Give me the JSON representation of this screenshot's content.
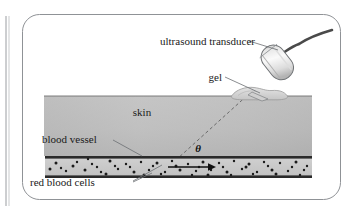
{
  "figure": {
    "type": "medical-illustration",
    "background_color": "#ffffff",
    "frame": {
      "name": "rounded-panel-border",
      "color": "#8f9296",
      "x": 22,
      "y": 14,
      "width": 319,
      "height": 186,
      "radius": 17
    },
    "left_rule": {
      "name": "page-margin-rule",
      "color": "#9a9da1",
      "x": 6,
      "y_top": 16,
      "y_bottom": 206
    },
    "labels": {
      "transducer": "ultrasound transducer",
      "gel": "gel",
      "skin": "skin",
      "blood_vessel": "blood vessel",
      "red_blood_cells": "red blood cells",
      "angle": "θ"
    },
    "colors": {
      "skin_fill_top": "#c3c3c3",
      "skin_fill_bottom": "#b0b0b0",
      "vessel_wall": "#2a2a2a",
      "vessel_lumen": "#c9c9c9",
      "red_blood_cell": "#1b1b1b",
      "transducer_body_light": "#f4f4f4",
      "transducer_body_shade": "#c4c4c4",
      "transducer_outline": "#6e7174",
      "cable": "#4a4a4a",
      "gel_fill": "#d8d8d8",
      "gel_outline": "#9b9b9b",
      "beam_dashed": "#6d6d6d",
      "leader_line": "#6b6e72",
      "text": "#1a1a1a"
    },
    "geometry": {
      "skin_surface_y": 96,
      "skin_left_x": 44,
      "skin_right_x": 312,
      "vessel_top_y": 156,
      "vessel_bottom_y": 178,
      "vessel_left_x": 45,
      "vessel_right_x": 312,
      "beam_start": {
        "x": 251,
        "y": 92
      },
      "beam_end": {
        "x": 176,
        "y": 160
      },
      "flow_arrow": {
        "x1": 168,
        "y1": 167,
        "x2": 214,
        "y2": 167
      }
    },
    "red_blood_cells_points": [
      [
        56,
        163
      ],
      [
        66,
        171
      ],
      [
        77,
        162
      ],
      [
        85,
        170
      ],
      [
        92,
        164
      ],
      [
        101,
        172
      ],
      [
        110,
        161
      ],
      [
        118,
        169
      ],
      [
        126,
        164
      ],
      [
        134,
        172
      ],
      [
        141,
        162
      ],
      [
        149,
        170
      ],
      [
        157,
        163
      ],
      [
        165,
        172
      ],
      [
        172,
        161
      ],
      [
        180,
        170
      ],
      [
        188,
        164
      ],
      [
        196,
        171
      ],
      [
        203,
        162
      ],
      [
        211,
        170
      ],
      [
        219,
        163
      ],
      [
        227,
        172
      ],
      [
        234,
        161
      ],
      [
        242,
        169
      ],
      [
        249,
        164
      ],
      [
        257,
        172
      ],
      [
        264,
        162
      ],
      [
        272,
        170
      ],
      [
        280,
        163
      ],
      [
        288,
        171
      ],
      [
        296,
        162
      ],
      [
        304,
        170
      ],
      [
        61,
        168
      ],
      [
        73,
        166
      ],
      [
        88,
        159
      ],
      [
        97,
        167
      ],
      [
        106,
        174
      ],
      [
        115,
        166
      ],
      [
        130,
        167
      ],
      [
        144,
        175
      ],
      [
        153,
        166
      ],
      [
        161,
        174
      ],
      [
        176,
        166
      ],
      [
        192,
        175
      ],
      [
        199,
        167
      ],
      [
        208,
        175
      ],
      [
        223,
        167
      ],
      [
        231,
        175
      ],
      [
        246,
        167
      ],
      [
        253,
        174
      ],
      [
        268,
        166
      ],
      [
        276,
        174
      ],
      [
        292,
        167
      ],
      [
        300,
        175
      ],
      [
        50,
        169
      ],
      [
        307,
        166
      ]
    ],
    "leaders": {
      "transducer": {
        "x1": 249,
        "y1": 41,
        "x2": 276,
        "y2": 51
      },
      "gel": {
        "x1": 225,
        "y1": 77,
        "x2": 259,
        "y2": 92
      },
      "blood_vessel": {
        "x1": 113,
        "y1": 140,
        "x2": 140,
        "y2": 156
      },
      "red_blood_cells_a": {
        "x1": 134,
        "y1": 180,
        "x2": 160,
        "y2": 166
      },
      "red_blood_cells_b": {
        "x1": 134,
        "y1": 181,
        "x2": 152,
        "y2": 172
      }
    }
  }
}
